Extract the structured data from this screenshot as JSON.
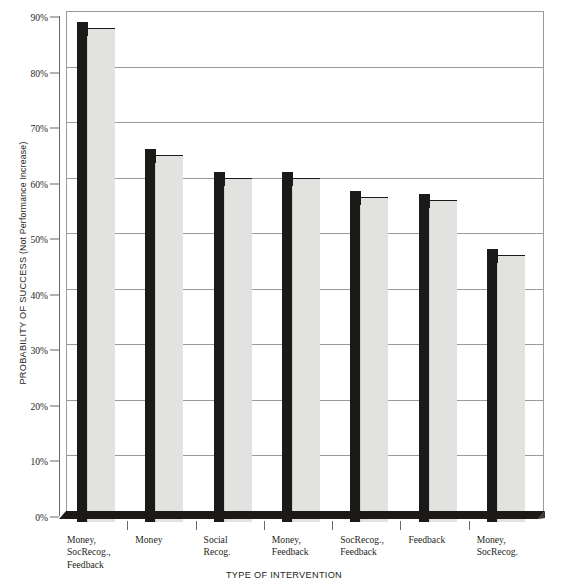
{
  "chart_data": {
    "type": "bar",
    "title": "",
    "subtitle": "",
    "xlabel": "TYPE OF INTERVENTION",
    "ylabel": "PROBABILITY OF SUCCESS (Not Performance Increase)",
    "ylabel_main": "PROBABILITY OF SUCCESS",
    "ylabel_paren": "(Not Performance Increase)",
    "categories": [
      "Money,\nSocRecog.,\nFeedback",
      "Money",
      "Social\nRecog.",
      "Money,\nFeedback",
      "SocRecog.,\nFeedback",
      "Feedback",
      "Money,\nSocRecog."
    ],
    "category_lines": [
      [
        "Money,",
        "SocRecog.,",
        "Feedback"
      ],
      [
        "Money"
      ],
      [
        "Social",
        "Recog."
      ],
      [
        "Money,",
        "Feedback"
      ],
      [
        "SocRecog.,",
        "Feedback"
      ],
      [
        "Feedback"
      ],
      [
        "Money,",
        "SocRecog."
      ]
    ],
    "values": [
      89,
      66,
      62,
      62,
      58.5,
      58,
      48
    ],
    "value_labels": [
      "89%",
      "66%",
      "62%",
      "62%",
      "58.5%",
      "58%",
      "48%"
    ],
    "ylim": [
      0,
      90
    ],
    "ytick_values": [
      0,
      10,
      20,
      30,
      40,
      50,
      60,
      70,
      80,
      90
    ],
    "ytick_labels": [
      "0%",
      "10%",
      "20%",
      "30%",
      "40%",
      "50%",
      "60%",
      "70%",
      "80%",
      "90%"
    ],
    "grid": true,
    "grid_axis": "y",
    "legend": false,
    "legend_position": "none",
    "style": "3d-column",
    "bar_face_color": "#e2e2e0",
    "bar_side_color": "#1c1a19",
    "grid_color": "#9d9996",
    "axis_color": "#6d6866",
    "background_color": "#ffffff"
  },
  "top_caption": "",
  "colors": {
    "ink": "#231f20",
    "axis": "#6d6866",
    "grid": "#9d9996",
    "bar_face": "#e2e2e0",
    "bar_side": "#1c1a19"
  }
}
